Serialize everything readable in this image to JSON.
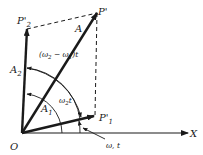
{
  "diagram": {
    "colors": {
      "ink": "#1a1a1a",
      "background": "#ffffff"
    },
    "points": {
      "origin": "O",
      "p_resultant": "P'",
      "p1": "P'",
      "p1_sub": "1",
      "p2": "P'",
      "p2_sub": "2",
      "x_axis": "X"
    },
    "vectors": {
      "resultant": "A",
      "a1": "A",
      "a1_sub": "1",
      "a2": "A",
      "a2_sub": "2"
    },
    "angles": {
      "diff_prefix": "(ω",
      "diff_sub2": "2",
      "diff_mid": " − ω",
      "diff_sub1": "1",
      "diff_suffix": ")t",
      "w2t": "ω",
      "w2t_sub": "2",
      "w2t_suffix": "t",
      "w1t": "ω, t"
    }
  }
}
